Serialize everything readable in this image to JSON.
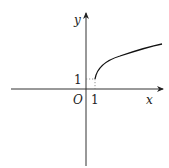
{
  "figure": {
    "type": "function-graph",
    "axes": {
      "x_label": "x",
      "y_label": "y",
      "origin_label": "O"
    },
    "ticks": {
      "x_tick_label": "1",
      "y_tick_label": "1"
    },
    "curve": {
      "description": "increasing concave curve starting at point (1, 1) and rising to the right",
      "start_point": [
        1,
        1
      ]
    },
    "colors": {
      "axis": "#333333",
      "curve": "#111111",
      "guide": "#777777"
    }
  }
}
